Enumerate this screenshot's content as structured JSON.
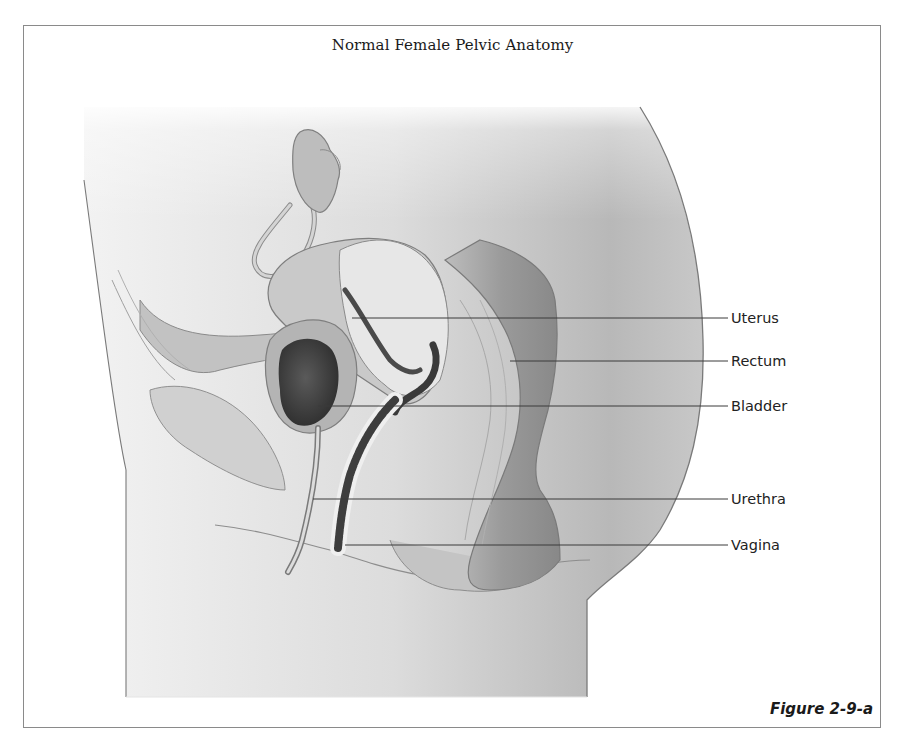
{
  "figure": {
    "title": "Normal Female Pelvic Anatomy",
    "caption": "Figure 2-9-a"
  },
  "labels": [
    {
      "text": "Uterus",
      "y": 318,
      "line_start_x": 352
    },
    {
      "text": "Rectum",
      "y": 361,
      "line_start_x": 510
    },
    {
      "text": "Bladder",
      "y": 406,
      "line_start_x": 318
    },
    {
      "text": "Urethra",
      "y": 499,
      "line_start_x": 313
    },
    {
      "text": "Vagina",
      "y": 545,
      "line_start_x": 345
    }
  ],
  "colors": {
    "frame_border": "#8a8a8a",
    "leader_line": "#3a3a3a",
    "body_fill": "#d8d8d8",
    "organ_dark": "#4a4a4a"
  }
}
